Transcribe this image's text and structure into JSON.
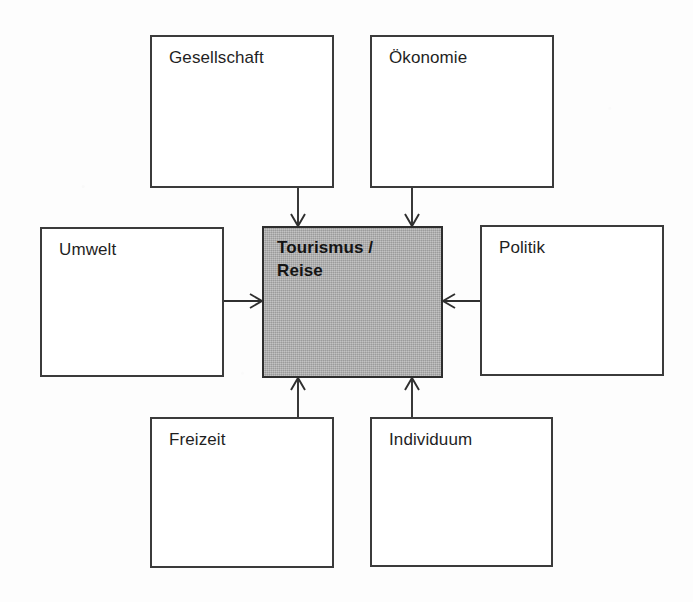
{
  "diagram": {
    "background_color": "#fdfdfd",
    "border_color": "#3b3b3b",
    "center_fill_color": "#ababab",
    "text_color": "#1f1f1f",
    "nodes": [
      {
        "id": "gesellschaft",
        "label": "Gesellschaft",
        "x": 150,
        "y": 35,
        "w": 184,
        "h": 153,
        "emphasis": false
      },
      {
        "id": "oekonomie",
        "label": "Ökonomie",
        "x": 370,
        "y": 35,
        "w": 184,
        "h": 153,
        "emphasis": false
      },
      {
        "id": "umwelt",
        "label": "Umwelt",
        "x": 40,
        "y": 227,
        "w": 184,
        "h": 150,
        "emphasis": false
      },
      {
        "id": "center",
        "label": "Tourismus /\nReise",
        "x": 262,
        "y": 226,
        "w": 181,
        "h": 152,
        "emphasis": true
      },
      {
        "id": "politik",
        "label": "Politik",
        "x": 480,
        "y": 225,
        "w": 184,
        "h": 151,
        "emphasis": false
      },
      {
        "id": "freizeit",
        "label": "Freizeit",
        "x": 150,
        "y": 417,
        "w": 184,
        "h": 151,
        "emphasis": false
      },
      {
        "id": "individuum",
        "label": "Individuum",
        "x": 370,
        "y": 417,
        "w": 183,
        "h": 150,
        "emphasis": false
      }
    ],
    "arrows": [
      {
        "id": "gesellschaft-to-center",
        "from": "gesellschaft",
        "to": "center",
        "direction": "down",
        "x1": 298,
        "y1": 188,
        "x2": 298,
        "y2": 226
      },
      {
        "id": "oekonomie-to-center",
        "from": "oekonomie",
        "to": "center",
        "direction": "down",
        "x1": 412,
        "y1": 188,
        "x2": 412,
        "y2": 226
      },
      {
        "id": "umwelt-to-center",
        "from": "umwelt",
        "to": "center",
        "direction": "right",
        "x1": 224,
        "y1": 301,
        "x2": 262,
        "y2": 301
      },
      {
        "id": "politik-to-center",
        "from": "politik",
        "to": "center",
        "direction": "left",
        "x1": 480,
        "y1": 301,
        "x2": 443,
        "y2": 301
      },
      {
        "id": "freizeit-to-center",
        "from": "freizeit",
        "to": "center",
        "direction": "up",
        "x1": 298,
        "y1": 417,
        "x2": 298,
        "y2": 378
      },
      {
        "id": "individuum-to-center",
        "from": "individuum",
        "to": "center",
        "direction": "up",
        "x1": 412,
        "y1": 417,
        "x2": 412,
        "y2": 378
      }
    ]
  }
}
